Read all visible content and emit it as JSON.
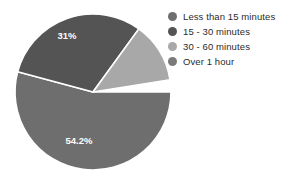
{
  "chart_data": {
    "type": "pie",
    "title": "",
    "subtitle": "",
    "xlabel": "",
    "ylabel": "",
    "grid": false,
    "legend_position": "right",
    "donut": false,
    "start_angle_deg": 90,
    "direction": "clockwise",
    "center": {
      "x": 93,
      "y": 92
    },
    "radius": 78,
    "categories": [
      "Less than 15 minutes",
      "15 - 30 minutes",
      "30 - 60 minutes",
      "Over 1 hour"
    ],
    "values": [
      54.2,
      31,
      12.6,
      2.2
    ],
    "value_unit": "%",
    "colors": [
      "#6e6e6e",
      "#545454",
      "#a8a8a8",
      "#7b7b7b"
    ],
    "slice_border_color": "#ffffff",
    "slice_border_width": 1.6,
    "exploded_slices": [
      "Over 1 hour"
    ],
    "data_labels": [
      {
        "text": "54.2%",
        "category": "Less than 15 minutes",
        "x": 79,
        "y": 141
      },
      {
        "text": "31%",
        "category": "15 - 30 minutes",
        "x": 67,
        "y": 36
      }
    ],
    "slices": [
      {
        "label": "Less than 15 minutes",
        "value": 54.2,
        "display_value": "54.2%",
        "color": "#6e6e6e",
        "start_deg": 90,
        "end_deg": 285,
        "exploded": false,
        "labeled": true
      },
      {
        "label": "15 - 30 minutes",
        "value": 31,
        "display_value": "31%",
        "color": "#545454",
        "start_deg": 285,
        "end_deg": 396,
        "exploded": false,
        "labeled": true
      },
      {
        "label": "30 - 60 minutes",
        "value": 12.6,
        "display_value": "",
        "color": "#a8a8a8",
        "start_deg": 396,
        "end_deg": 441,
        "exploded": false,
        "labeled": false
      },
      {
        "label": "Over 1 hour",
        "value": 2.2,
        "display_value": "",
        "color": "#7b7b7b",
        "start_deg": 442,
        "end_deg": 450,
        "exploded": true,
        "labeled": false
      }
    ]
  },
  "legend": {
    "items": [
      {
        "label": "Less than 15 minutes",
        "color": "#6e6e6e",
        "marker": "circle-swatch-icon"
      },
      {
        "label": "15 - 30 minutes",
        "color": "#545454",
        "marker": "circle-swatch-icon"
      },
      {
        "label": "30 - 60 minutes",
        "color": "#a8a8a8",
        "marker": "circle-swatch-icon"
      },
      {
        "label": "Over 1 hour",
        "color": "#7b7b7b",
        "marker": "circle-swatch-icon"
      }
    ]
  },
  "page": {
    "background": "#ffffff"
  }
}
